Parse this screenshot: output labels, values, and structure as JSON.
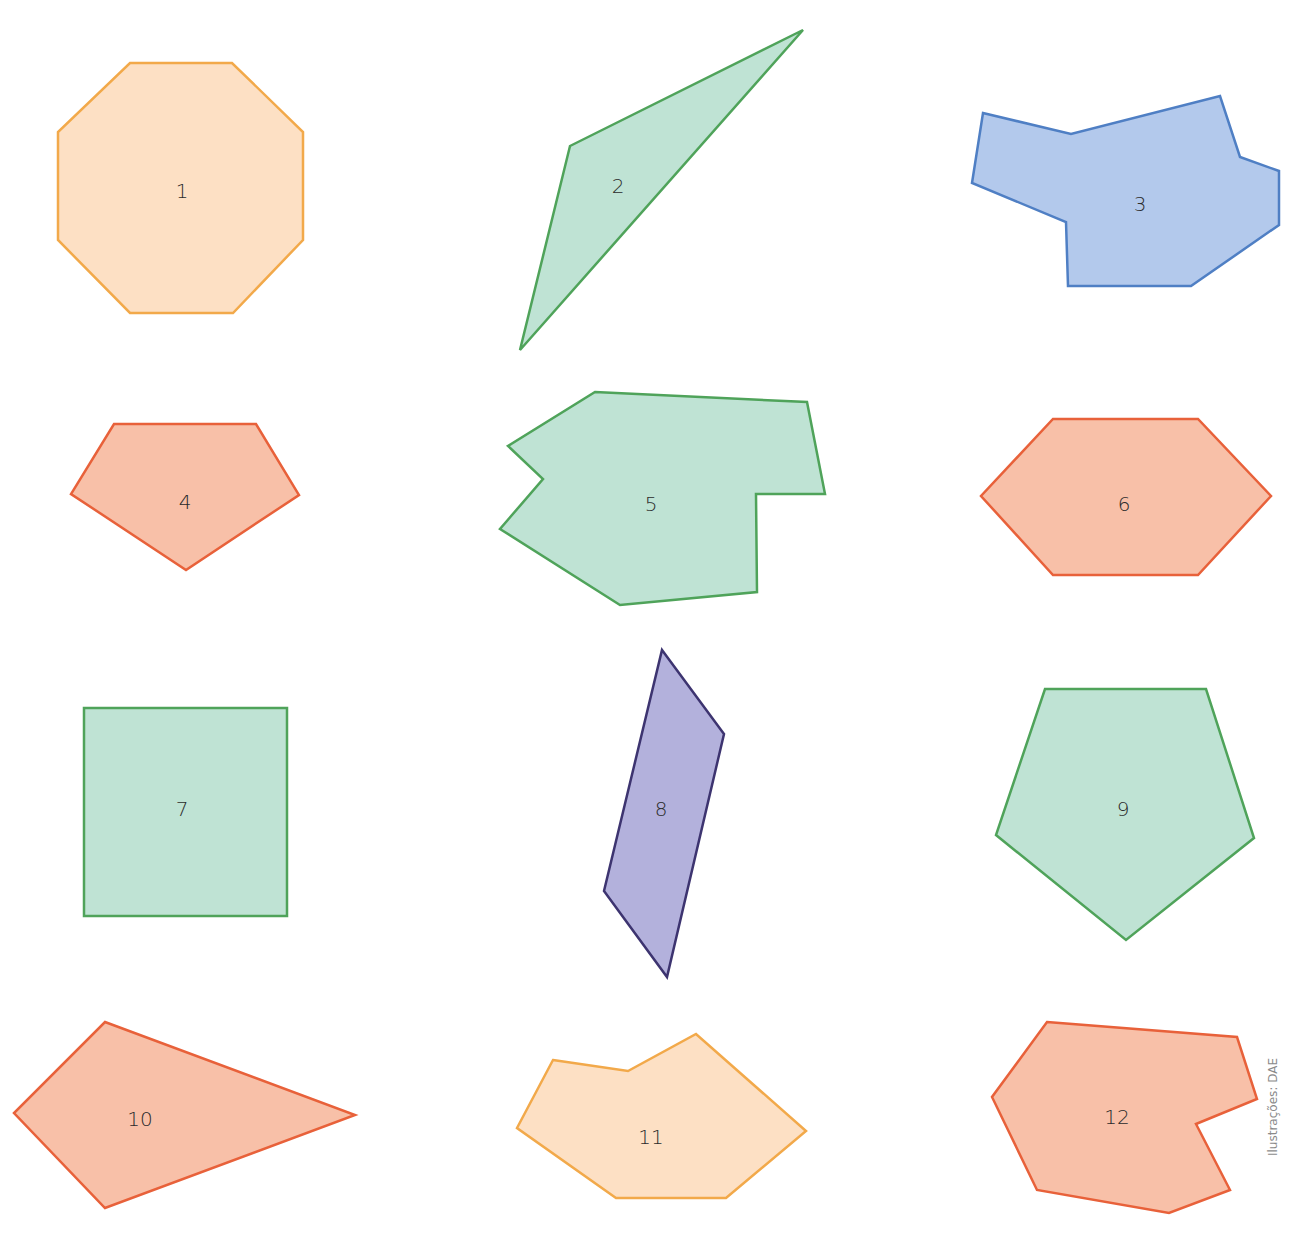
{
  "figure": {
    "credit": "Ilustrações: DAE",
    "palette": {
      "orange": {
        "fill": "#fde0c4",
        "stroke": "#f2a94a"
      },
      "green": {
        "fill": "#bfe3d4",
        "stroke": "#4fa35a"
      },
      "blue": {
        "fill": "#b3c9ec",
        "stroke": "#4f7fc4"
      },
      "salmon": {
        "fill": "#f8c0a8",
        "stroke": "#e8613a"
      },
      "purple": {
        "fill": "#b3b1dc",
        "stroke": "#3d3470"
      }
    },
    "shapes": [
      {
        "label": "1",
        "kind": "regular octagon",
        "color": "orange"
      },
      {
        "label": "2",
        "kind": "obtuse triangle",
        "color": "green"
      },
      {
        "label": "3",
        "kind": "irregular decagon",
        "color": "blue"
      },
      {
        "label": "4",
        "kind": "pentagon",
        "color": "salmon"
      },
      {
        "label": "5",
        "kind": "irregular nonagon",
        "color": "green"
      },
      {
        "label": "6",
        "kind": "hexagon",
        "color": "salmon"
      },
      {
        "label": "7",
        "kind": "rectangle",
        "color": "green"
      },
      {
        "label": "8",
        "kind": "parallelogram",
        "color": "purple"
      },
      {
        "label": "9",
        "kind": "regular pentagon",
        "color": "green"
      },
      {
        "label": "10",
        "kind": "kite",
        "color": "salmon"
      },
      {
        "label": "11",
        "kind": "irregular heptagon",
        "color": "orange"
      },
      {
        "label": "12",
        "kind": "irregular octagon",
        "color": "salmon"
      }
    ]
  }
}
